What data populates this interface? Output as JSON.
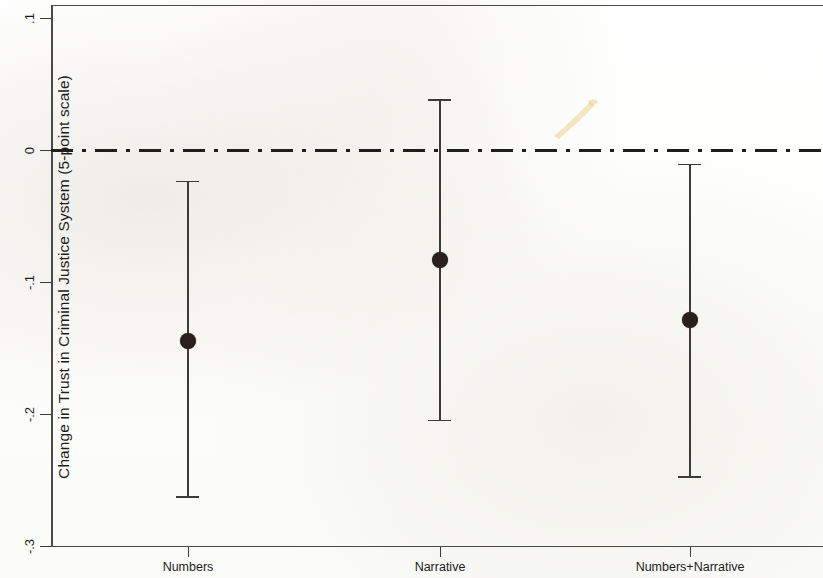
{
  "chart_data": {
    "type": "scatter",
    "title": "",
    "subtitle": "",
    "xlabel": "",
    "ylabel": "Change in Trust in Criminal Justice System (5-point scale)",
    "categories": [
      "Numbers",
      "Narrative",
      "Numbers+Narrative"
    ],
    "ylim": [
      -0.3,
      0.1
    ],
    "yticks": [
      0.1,
      0,
      -0.1,
      -0.2,
      -0.3
    ],
    "ytick_labels": [
      ".1",
      "0",
      "-.1",
      "-.2",
      "-.3"
    ],
    "grid": false,
    "legend": "none",
    "reference_line": {
      "value": 0,
      "style": "dash-dot",
      "label": "0"
    },
    "series": [
      {
        "name": "Treatment effect (point estimate with 95% confidence interval)",
        "values": [
          -0.145,
          -0.083,
          -0.129
        ],
        "ci_low": [
          -0.263,
          -0.205,
          -0.248
        ],
        "ci_high": [
          -0.024,
          0.038,
          -0.011
        ]
      }
    ],
    "annotations": []
  },
  "axes": {
    "y_tick_labels": [
      ".1",
      "0",
      "-.1",
      "-.2",
      "-.3"
    ],
    "y_axis_title": "Change in Trust in Criminal Justice System (5-point scale)",
    "x_tick_labels": [
      "Numbers",
      "Narrative",
      "Numbers+Narrative"
    ]
  },
  "colors": {
    "marker": "#2a1f1c",
    "line": "#3b3b38",
    "frame": "#4a4a47",
    "background": "#fefefd",
    "smudge": "#e8d79a"
  }
}
